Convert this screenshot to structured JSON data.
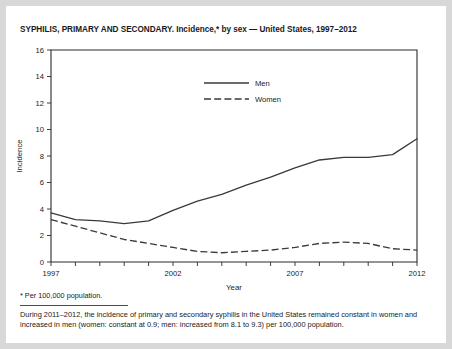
{
  "figure": {
    "title": "SYPHILIS, PRIMARY AND SECONDARY. Incidence,* by sex — United States, 1997–2012",
    "footnote": "* Per 100,000 population.",
    "note": "During 2011–2012, the incidence of primary and secondary syphilis in the United States remained constant in women and increased in men (women: constant at 0.9; men: increased from 8.1 to 9.3) per 100,000 population.",
    "background_color": "#ffffff",
    "page_color": "#d8d8d8",
    "line_color": "#3a3a3a",
    "axis_color": "#2b2b2b"
  },
  "chart_data": {
    "type": "line",
    "title": "SYPHILIS, PRIMARY AND SECONDARY. Incidence,* by sex — United States, 1997–2012",
    "xlabel": "Year",
    "ylabel": "Incidence",
    "xlim": [
      1997,
      2012
    ],
    "ylim": [
      0,
      16
    ],
    "ytick_step": 2,
    "yticks": [
      0,
      2,
      4,
      6,
      8,
      10,
      12,
      14,
      16
    ],
    "ytick_labels": [
      "0",
      "2",
      "4",
      "6",
      "8",
      "10",
      "12",
      "14",
      "16"
    ],
    "x": [
      1997,
      1998,
      1999,
      2000,
      2001,
      2002,
      2003,
      2004,
      2005,
      2006,
      2007,
      2008,
      2009,
      2010,
      2011,
      2012
    ],
    "xtick_labels_shown": [
      "1997",
      "2002",
      "2007",
      "2012"
    ],
    "xtick_label_years": [
      1997,
      2002,
      2007,
      2012
    ],
    "grid": false,
    "legend_position": "upper center",
    "series": [
      {
        "name": "Men",
        "style": "solid",
        "values": [
          3.7,
          3.2,
          3.1,
          2.9,
          3.1,
          3.9,
          4.6,
          5.1,
          5.8,
          6.4,
          7.1,
          7.7,
          7.9,
          7.9,
          8.1,
          9.3
        ]
      },
      {
        "name": "Women",
        "style": "dashed",
        "values": [
          3.2,
          2.7,
          2.2,
          1.7,
          1.4,
          1.1,
          0.8,
          0.7,
          0.8,
          0.9,
          1.1,
          1.4,
          1.5,
          1.4,
          1.0,
          0.9
        ]
      }
    ]
  },
  "legend": {
    "items": [
      {
        "label": "Men",
        "style": "solid"
      },
      {
        "label": "Women",
        "style": "dashed"
      }
    ]
  },
  "axes": {
    "x_title": "Year",
    "y_title": "Incidence"
  }
}
